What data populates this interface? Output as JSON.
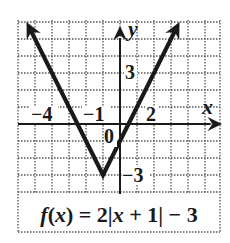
{
  "chart_data": {
    "type": "line",
    "function": "f(x) = 2|x + 1| - 3",
    "xlabel": "x",
    "ylabel": "y",
    "xlim": [
      -6,
      6
    ],
    "ylim": [
      -4,
      6
    ],
    "grid": true,
    "grid_style": "dotted",
    "grid_step": 1,
    "tick_labels": {
      "x": [
        {
          "value": -4,
          "label": "−4"
        },
        {
          "value": -1,
          "label": "−1"
        },
        {
          "value": 2,
          "label": "2"
        }
      ],
      "y": [
        {
          "value": 3,
          "label": "3"
        },
        {
          "value": -3,
          "label": "−3"
        }
      ],
      "origin": "0"
    },
    "series": [
      {
        "name": "f(x) = 2|x + 1| - 3",
        "x": [
          -5.5,
          -1,
          3.5
        ],
        "y": [
          6,
          -3,
          6
        ],
        "arrows": "both-ends",
        "vertex": {
          "x": -1,
          "y": -3
        }
      }
    ],
    "colors": {
      "curve": "#1a1a1a",
      "axis": "#1a1a1a",
      "grid": "#555555",
      "background": "#ffffff"
    }
  },
  "labels": {
    "formula_f": "f",
    "formula_open": "(",
    "formula_x": "x",
    "formula_mid": ") = 2|",
    "formula_x2": "x",
    "formula_end": " + 1| − 3"
  }
}
